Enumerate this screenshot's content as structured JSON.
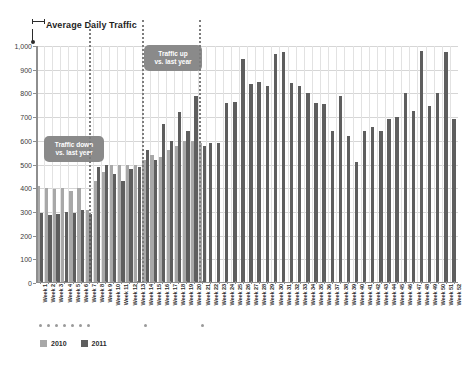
{
  "chart_data": {
    "type": "bar",
    "title": "Average Daily Traffic",
    "xlabel": "",
    "ylabel": "",
    "ylim": [
      0,
      1000
    ],
    "ytick_labels": [
      "0",
      "100",
      "200",
      "300",
      "400",
      "500",
      "600",
      "700",
      "800",
      "900",
      "1,000"
    ],
    "ytick_values": [
      0,
      100,
      200,
      300,
      400,
      500,
      600,
      700,
      800,
      900,
      1000
    ],
    "grid": true,
    "legend_position": "bottom-left",
    "categories": [
      "Week 1",
      "Week 2",
      "Week 3",
      "Week 4",
      "Week 5",
      "Week 6",
      "Week 7",
      "Week 8",
      "Week 9",
      "Week 10",
      "Week 11",
      "Week 12",
      "Week 13",
      "Week 14",
      "Week 15",
      "Week 16",
      "Week 17",
      "Week 18",
      "Week 19",
      "Week 20",
      "Week 21",
      "Week 22",
      "Week 23",
      "Week 24",
      "Week 25",
      "Week 26",
      "Week 27",
      "Week 28",
      "Week 29",
      "Week 30",
      "Week 31",
      "Week 32",
      "Week 33",
      "Week 34",
      "Week 35",
      "Week 36",
      "Week 37",
      "Week 38",
      "Week 39",
      "Week 40",
      "Week 41",
      "Week 42",
      "Week 43",
      "Week 44",
      "Week 45",
      "Week 46",
      "Week 47",
      "Week 48",
      "Week 49",
      "Week 50",
      "Week 51",
      "Week 52"
    ],
    "series": [
      {
        "name": "2010",
        "color": "#a8a8a8",
        "values": [
          410,
          400,
          395,
          400,
          390,
          400,
          310,
          430,
          470,
          500,
          500,
          500,
          500,
          520,
          540,
          530,
          560,
          580,
          600,
          600,
          590,
          null,
          null,
          null,
          null,
          null,
          null,
          null,
          null,
          null,
          null,
          null,
          null,
          null,
          null,
          null,
          null,
          null,
          null,
          null,
          null,
          null,
          null,
          null,
          null,
          null,
          null,
          null,
          null,
          null,
          null,
          null
        ]
      },
      {
        "name": "2011",
        "color": "#5e5e5e",
        "values": [
          295,
          285,
          290,
          300,
          295,
          310,
          290,
          490,
          500,
          460,
          430,
          480,
          490,
          560,
          520,
          670,
          600,
          720,
          640,
          790,
          580,
          590,
          590,
          760,
          765,
          945,
          840,
          850,
          830,
          965,
          975,
          845,
          830,
          800,
          760,
          755,
          640,
          790,
          620,
          510,
          640,
          660,
          640,
          690,
          700,
          800,
          725,
          980,
          745,
          800,
          975,
          690
        ]
      }
    ],
    "annotations": [
      {
        "text": "Traffic down\nvs. last year",
        "color": "#8a8a8a"
      },
      {
        "text": "Traffic up\nvs. last year",
        "color": "#8a8a8a"
      }
    ]
  },
  "legend": {
    "items": [
      {
        "label": "2010",
        "color": "#a8a8a8"
      },
      {
        "label": "2011",
        "color": "#5e5e5e"
      }
    ]
  },
  "icons": {
    "title_marker": "bracket-pointer-icon"
  }
}
